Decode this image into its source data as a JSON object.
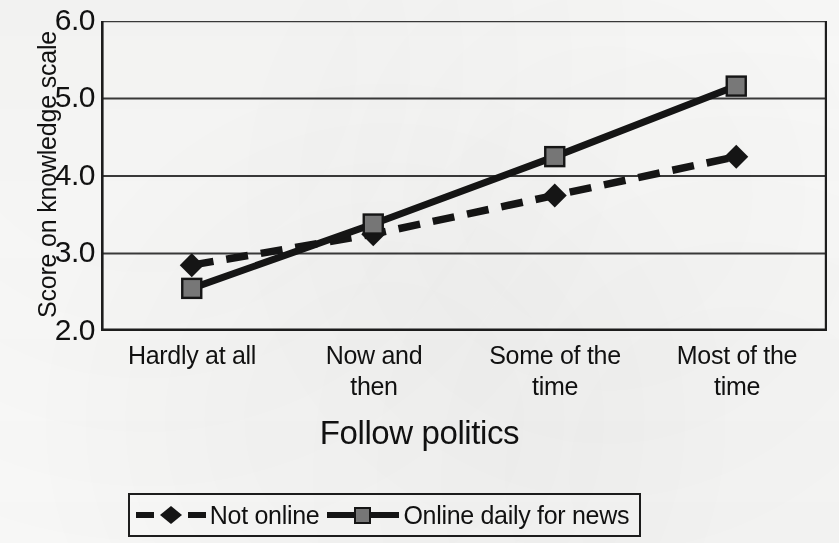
{
  "chart_data": {
    "type": "line",
    "title": "",
    "subtitle": "",
    "xlabel": "Follow politics",
    "ylabel": "Score on knowledge scale",
    "categories": [
      "Hardly at all",
      "Now and then",
      "Some of the time",
      "Most of the time"
    ],
    "category_lines": [
      [
        "Hardly at all",
        ""
      ],
      [
        "Now and",
        "then"
      ],
      [
        "Some of the",
        "time"
      ],
      [
        "Most of the",
        "time"
      ]
    ],
    "ylim": [
      2.0,
      6.0
    ],
    "yticks": [
      "6.0",
      "5.0",
      "4.0",
      "3.0",
      "2.0"
    ],
    "ytick_values": [
      6.0,
      5.0,
      4.0,
      3.0,
      2.0
    ],
    "grid": "horizontal",
    "legend_position": "bottom",
    "series": [
      {
        "name": "Not online",
        "values": [
          2.85,
          3.25,
          3.75,
          4.25
        ],
        "marker": "diamond",
        "marker_color": "#151515",
        "line_color": "#151515",
        "line_style": "dashed"
      },
      {
        "name": "Online daily for news",
        "values": [
          2.55,
          3.38,
          4.25,
          5.16
        ],
        "marker": "square",
        "marker_color": "#7b7b7b",
        "line_color": "#151515",
        "line_style": "solid"
      }
    ]
  },
  "axes": {
    "y_title": "Score on knowledge scale",
    "x_title": "Follow politics"
  },
  "legend": {
    "items": [
      {
        "label": "Not online",
        "style": "dashed",
        "marker": "diamond"
      },
      {
        "label": "Online daily for news",
        "style": "solid",
        "marker": "square"
      }
    ]
  },
  "colors": {
    "axis": "#1d1d1d",
    "grid": "#3a3a3a",
    "series_not_online": "#151515",
    "series_online_marker": "#7b7b7b",
    "background": "#fbfbfa"
  }
}
